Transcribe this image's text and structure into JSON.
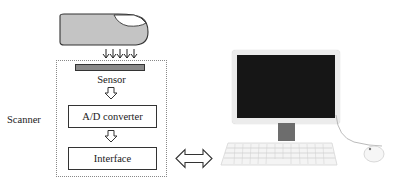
{
  "diagram": {
    "scanner_label": "Scanner",
    "sensor_label": "Sensor",
    "ad_converter_label": "A/D converter",
    "interface_label": "Interface",
    "finger_arrow_count": 5
  },
  "colors": {
    "finger_fill": "#c4c4c4",
    "sensor_fill": "#8a8a8a",
    "screen": "#161616",
    "monitor_frame": "#ececec",
    "stand": "#6d6d6d",
    "line": "#333333"
  }
}
